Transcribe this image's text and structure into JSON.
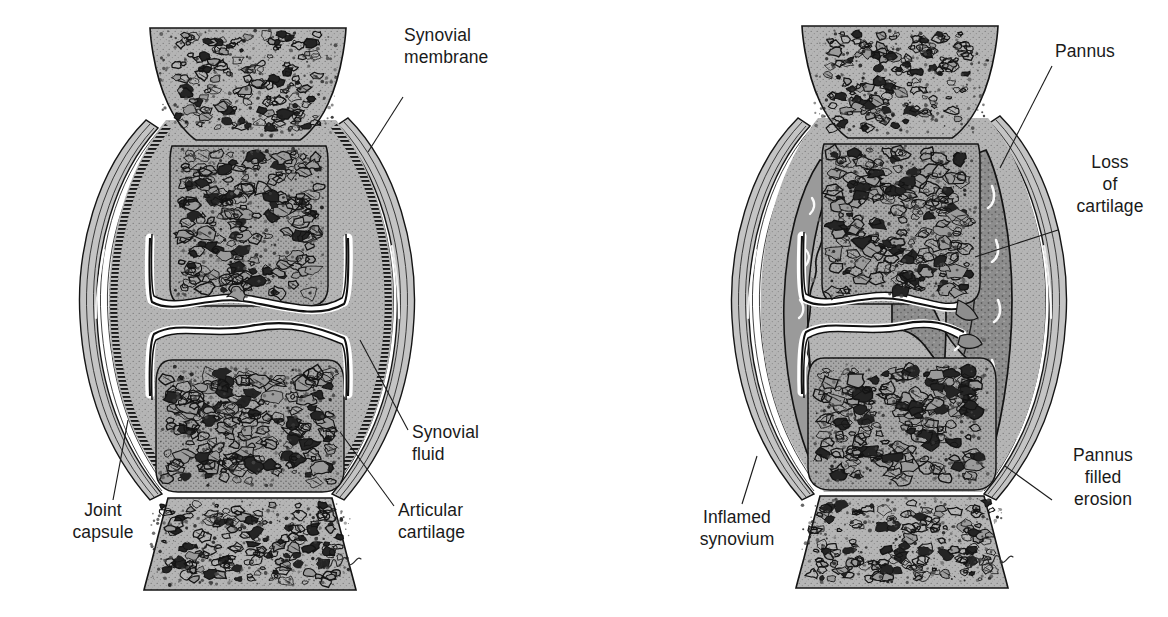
{
  "figure": {
    "type": "medical-illustration",
    "background_color": "#ffffff",
    "ink_color": "#1a1a1a"
  },
  "palette": {
    "bone_fill": "#b3b3b3",
    "bone_dense_fill": "#a8a8a8",
    "capsule_fill": "#bdbdbd",
    "cartilage_fill": "#ffffff",
    "pannus_fill": "#8f8f8f",
    "synovium_inflamed_fill": "#9a9a9a",
    "trabecula_stroke": "#1a1a1a",
    "outline": "#111111"
  },
  "panels": [
    {
      "id": "normal-joint",
      "name": "normal-synovial-joint",
      "side": "left",
      "signature": "A.Wikmor",
      "labels": [
        {
          "id": "synovial-membrane",
          "lines": [
            "Synovial",
            "membrane"
          ],
          "text_x": 404,
          "text_y": 41,
          "anchor": "start",
          "leader": "M 403 97 L 368 152"
        },
        {
          "id": "synovial-fluid",
          "lines": [
            "Synovial",
            "fluid"
          ],
          "text_x": 412,
          "text_y": 438,
          "anchor": "start",
          "leader": "M 408 430 L 360 340"
        },
        {
          "id": "articular-cartilage",
          "lines": [
            "Articular",
            "cartilage"
          ],
          "text_x": 398,
          "text_y": 516,
          "anchor": "start",
          "leader": "M 394 506 L 340 432"
        },
        {
          "id": "joint-capsule",
          "lines": [
            "Joint",
            "capsule"
          ],
          "text_x": 103,
          "text_y": 516,
          "anchor": "middle",
          "leader": "M 113 500 L 128 420"
        }
      ]
    },
    {
      "id": "rheumatoid-joint",
      "name": "rheumatoid-joint-with-pannus",
      "side": "right",
      "signature": "A.Wikmor",
      "labels": [
        {
          "id": "pannus",
          "lines": [
            "Pannus"
          ],
          "text_x": 1055,
          "text_y": 57,
          "anchor": "start",
          "leader": "M 1052 66 L 1000 168"
        },
        {
          "id": "loss-of-cartilage",
          "lines": [
            "Loss",
            "of",
            "cartilage"
          ],
          "text_x": 1110,
          "text_y": 168,
          "anchor": "middle",
          "leader": "M 1058 230 L 975 257"
        },
        {
          "id": "pannus-filled-erosion",
          "lines": [
            "Pannus",
            "filled",
            "erosion"
          ],
          "text_x": 1103,
          "text_y": 461,
          "anchor": "middle",
          "leader": "M 1052 500 L 1005 466"
        },
        {
          "id": "inflamed-synovium",
          "lines": [
            "Inflamed",
            "synovium"
          ],
          "text_x": 737,
          "text_y": 523,
          "anchor": "middle",
          "leader": "M 742 504 L 757 456"
        }
      ]
    }
  ]
}
